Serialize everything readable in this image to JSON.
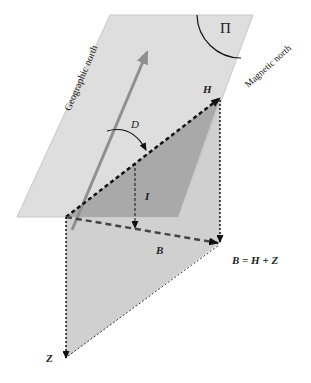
{
  "labels": {
    "plane": "Π",
    "geographic_north": "Geographic north",
    "magnetic_north": "Magnetic north",
    "H": "H",
    "D": "D",
    "I": "I",
    "B": "B",
    "Z": "Z",
    "equation": "B = H + Z"
  },
  "colors": {
    "plane": "#dcdcdc",
    "vertical_plane": "#c4c4c4",
    "triangle": "#a8a8a8",
    "geo_arrow": "#8f8f8f",
    "line": "#111111"
  }
}
